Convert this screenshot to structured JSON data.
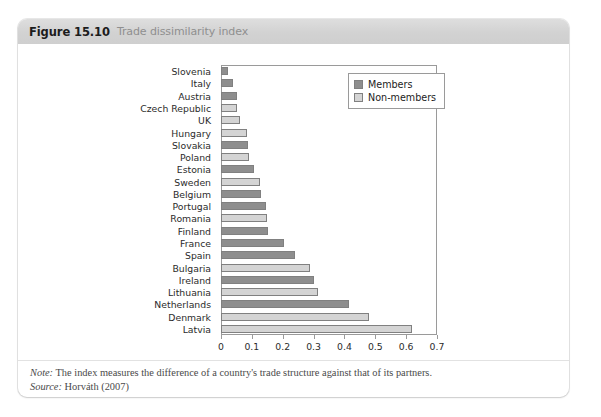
{
  "figure": {
    "number": "Figure 15.10",
    "caption": "Trade dissimilarity index"
  },
  "legend": {
    "items": [
      {
        "label": "Members",
        "key": "members",
        "color": "#8e8e8e"
      },
      {
        "label": "Non-members",
        "key": "nonmembers",
        "color": "#d4d4d4"
      }
    ]
  },
  "footer": {
    "note_key": "Note:",
    "note_text": "The index measures the difference of a country's trade structure against that of its partners.",
    "source_key": "Source:",
    "source_text": "Horváth (2007)"
  },
  "chart_data": {
    "type": "bar",
    "orientation": "horizontal",
    "title": "Trade dissimilarity index",
    "xlabel": "",
    "ylabel": "",
    "xlim": [
      0,
      0.7
    ],
    "xticks": [
      0,
      0.1,
      0.2,
      0.3,
      0.4,
      0.5,
      0.6,
      0.7
    ],
    "xtick_labels": [
      "0",
      "0.1",
      "0.2",
      "0.3",
      "0.4",
      "0.5",
      "0.6",
      "0.7"
    ],
    "grid": false,
    "legend_position": "top-right",
    "categories": [
      "Slovenia",
      "Italy",
      "Austria",
      "Czech Republic",
      "UK",
      "Hungary",
      "Slovakia",
      "Poland",
      "Estonia",
      "Sweden",
      "Belgium",
      "Portugal",
      "Romania",
      "Finland",
      "France",
      "Spain",
      "Bulgaria",
      "Ireland",
      "Lithuania",
      "Netherlands",
      "Denmark",
      "Latvia"
    ],
    "values": [
      0.022,
      0.04,
      0.052,
      0.053,
      0.062,
      0.085,
      0.086,
      0.092,
      0.106,
      0.125,
      0.131,
      0.146,
      0.148,
      0.152,
      0.205,
      0.24,
      0.287,
      0.302,
      0.315,
      0.415,
      0.48,
      0.62
    ],
    "groups": [
      "members",
      "members",
      "members",
      "nonmembers",
      "nonmembers",
      "nonmembers",
      "members",
      "nonmembers",
      "members",
      "nonmembers",
      "members",
      "members",
      "nonmembers",
      "members",
      "members",
      "members",
      "nonmembers",
      "members",
      "nonmembers",
      "members",
      "nonmembers",
      "nonmembers"
    ]
  }
}
